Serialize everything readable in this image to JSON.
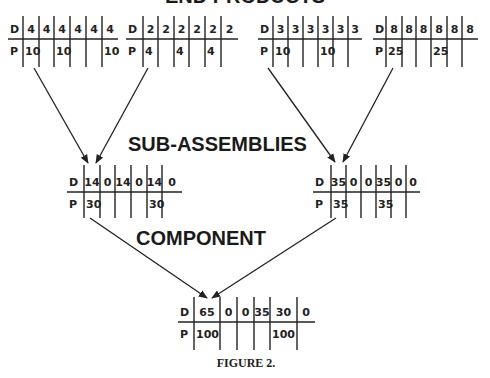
{
  "diagram": {
    "level_titles": {
      "end_products": "END PRODUCTS",
      "sub_assemblies": "SUB-ASSEMBLIES",
      "component": "COMPONENT"
    },
    "caption": "FIGURE 2.",
    "row_labels": {
      "demand": "D",
      "planned": "P"
    },
    "tables": [
      {
        "id": "end-product-1",
        "level": "end_products",
        "D": [
          "4",
          "4",
          "4",
          "4",
          "4",
          "4"
        ],
        "P": [
          "10",
          "",
          "10",
          "",
          "",
          "10"
        ]
      },
      {
        "id": "end-product-2",
        "level": "end_products",
        "D": [
          "2",
          "2",
          "2",
          "2",
          "2",
          "2"
        ],
        "P": [
          "4",
          "",
          "4",
          "",
          "4",
          ""
        ]
      },
      {
        "id": "end-product-3",
        "level": "end_products",
        "D": [
          "3",
          "3",
          "3",
          "3",
          "3",
          "3"
        ],
        "P": [
          "10",
          "",
          "",
          "10",
          "",
          ""
        ]
      },
      {
        "id": "end-product-4",
        "level": "end_products",
        "D": [
          "8",
          "8",
          "8",
          "8",
          "8",
          "8"
        ],
        "P": [
          "25",
          "",
          "",
          "25",
          "",
          ""
        ]
      },
      {
        "id": "sub-assembly-1",
        "level": "sub_assemblies",
        "D": [
          "14",
          "0",
          "14",
          "0",
          "14",
          "0"
        ],
        "P": [
          "30",
          "",
          "",
          "",
          "30",
          ""
        ]
      },
      {
        "id": "sub-assembly-2",
        "level": "sub_assemblies",
        "D": [
          "35",
          "0",
          "0",
          "35",
          "0",
          "0"
        ],
        "P": [
          "35",
          "",
          "",
          "35",
          "",
          ""
        ]
      },
      {
        "id": "component-1",
        "level": "component",
        "D": [
          "65",
          "0",
          "0",
          "35",
          "30",
          "0"
        ],
        "P": [
          "100",
          "",
          "",
          "",
          "100",
          ""
        ]
      }
    ],
    "links": [
      {
        "from": "end-product-1",
        "to": "sub-assembly-1"
      },
      {
        "from": "end-product-2",
        "to": "sub-assembly-1"
      },
      {
        "from": "end-product-3",
        "to": "sub-assembly-2"
      },
      {
        "from": "end-product-4",
        "to": "sub-assembly-2"
      },
      {
        "from": "sub-assembly-1",
        "to": "component-1"
      },
      {
        "from": "sub-assembly-2",
        "to": "component-1"
      }
    ]
  }
}
